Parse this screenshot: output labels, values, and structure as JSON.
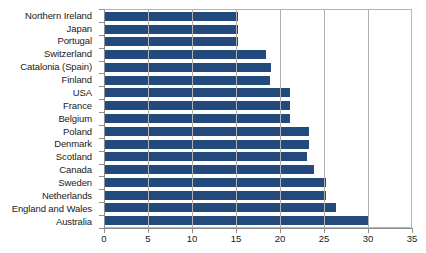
{
  "chart_data": {
    "type": "bar",
    "orientation": "horizontal",
    "title": "",
    "xlabel": "",
    "ylabel": "",
    "xlim": [
      0,
      35
    ],
    "xticks": [
      0,
      5,
      10,
      15,
      20,
      25,
      30,
      35
    ],
    "xtick_labels": [
      "0",
      "5",
      "10",
      "15",
      "20",
      "25",
      "30",
      "35"
    ],
    "grid": "vertical",
    "legend": "none",
    "bar_color": "#234a7d",
    "categories": [
      "Northern Ireland",
      "Japan",
      "Portugal",
      "Switzerland",
      "Catalonia (Spain)",
      "Finland",
      "USA",
      "France",
      "Belgium",
      "Poland",
      "Denmark",
      "Scotland",
      "Canada",
      "Sweden",
      "Netherlands",
      "England and Wales",
      "Australia"
    ],
    "values": [
      15.1,
      15.1,
      15.1,
      18.3,
      18.9,
      18.7,
      21.0,
      21.0,
      21.0,
      23.2,
      23.2,
      23.0,
      23.8,
      25.1,
      25.1,
      26.3,
      30.0
    ]
  },
  "axis": {
    "background": "#ffffff",
    "frame_color": "#b6b6b6",
    "gridline_color": "#b0b0b0",
    "tick_color": "#8d8d8d",
    "text_color": "#1a1a1a"
  }
}
